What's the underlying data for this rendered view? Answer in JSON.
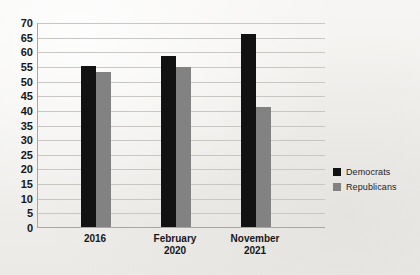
{
  "chart_data": {
    "type": "bar",
    "title": "",
    "xlabel": "",
    "ylabel": "",
    "categories": [
      "2016",
      "February\n2020",
      "November\n2021"
    ],
    "category_lines": [
      [
        "2016"
      ],
      [
        "February",
        "2020"
      ],
      [
        "November",
        "2021"
      ]
    ],
    "series": [
      {
        "name": "Democrats",
        "color": "#121212",
        "values": [
          55,
          58.5,
          66
        ]
      },
      {
        "name": "Republicans",
        "color": "#828282",
        "values": [
          53,
          54.5,
          41
        ]
      }
    ],
    "ylim": [
      0,
      70
    ],
    "ytick_step": 5,
    "yticks": [
      "70",
      "65",
      "60",
      "55",
      "50",
      "45",
      "40",
      "35",
      "30",
      "25",
      "20",
      "15",
      "10",
      "5",
      "0"
    ],
    "grid": true,
    "legend_position": "right"
  },
  "legend": {
    "items": [
      {
        "label": "Democrats",
        "color": "#121212"
      },
      {
        "label": "Republicans",
        "color": "#828282"
      }
    ]
  }
}
